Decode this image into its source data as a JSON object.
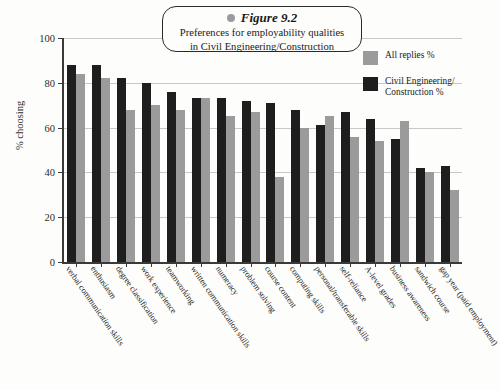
{
  "figure": {
    "bullet_icon": "gray-dot-icon",
    "label": "Figure 9.2",
    "subtitle_line1": "Preferences for employability qualities",
    "subtitle_line2": "in Civil Engineering/Construction"
  },
  "legend": {
    "position": "top-right",
    "items": [
      {
        "label": "All replies %",
        "color": "#9b9b9b",
        "swatch": "light-gray-swatch"
      },
      {
        "label": "Civil Engineering/ Construction %",
        "color": "#1e1e1e",
        "swatch": "black-swatch"
      }
    ]
  },
  "axes": {
    "y_title": "% choosing",
    "y_ticks": [
      "0",
      "20",
      "40",
      "60",
      "80",
      "100"
    ],
    "y_min": 0,
    "y_max": 100
  },
  "chart_data": {
    "type": "bar",
    "title": "Figure 9.2",
    "subtitle": "Preferences for employability qualities in Civil Engineering/Construction",
    "xlabel": "",
    "ylabel": "% choosing",
    "ylim": [
      0,
      100
    ],
    "grid": true,
    "legend_position": "top-right",
    "categories": [
      "verbal communication skills",
      "enthusiasm",
      "degree classification",
      "work experience",
      "teamworking",
      "written communication skills",
      "numeracy",
      "problem solving",
      "course content",
      "computing skills",
      "personal/transferable skills",
      "self-reliance",
      "A-level grades",
      "business awareness",
      "sandwich course",
      "gap year (paid employment)"
    ],
    "series": [
      {
        "name": "Civil Engineering/Construction %",
        "color": "#1e1e1e",
        "values": [
          88,
          88,
          82,
          80,
          76,
          73,
          73,
          72,
          71,
          68,
          61,
          67,
          64,
          55,
          42,
          43
        ]
      },
      {
        "name": "All replies %",
        "color": "#9b9b9b",
        "values": [
          84,
          82,
          68,
          70,
          68,
          73,
          65,
          67,
          38,
          60,
          65,
          56,
          54,
          63,
          40,
          32
        ]
      }
    ]
  }
}
